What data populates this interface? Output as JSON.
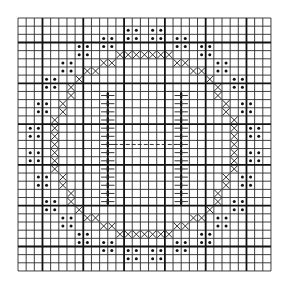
{
  "chart": {
    "title": "",
    "type": "stitch-pattern-grid",
    "origin_px": [
      18,
      18
    ],
    "cell_px": 8.16,
    "cols": 31,
    "rows": 31,
    "major_line_every": 5,
    "major_line_offset": 3,
    "colors": {
      "background": "#ffffff",
      "grid": "#2a2a2a",
      "grid_major": "#111111",
      "symbol": "#111111"
    },
    "legend": {
      "x_symbol": "cross-stitch",
      "dot_symbol": "dot-stitch",
      "ladder_symbol": "vertical-ladder"
    },
    "x_cells": [
      [
        4,
        12
      ],
      [
        4,
        13
      ],
      [
        4,
        14
      ],
      [
        4,
        15
      ],
      [
        4,
        16
      ],
      [
        4,
        17
      ],
      [
        4,
        18
      ],
      [
        26,
        12
      ],
      [
        26,
        13
      ],
      [
        26,
        14
      ],
      [
        26,
        15
      ],
      [
        26,
        16
      ],
      [
        26,
        17
      ],
      [
        26,
        18
      ],
      [
        12,
        4
      ],
      [
        13,
        4
      ],
      [
        14,
        4
      ],
      [
        15,
        4
      ],
      [
        16,
        4
      ],
      [
        17,
        4
      ],
      [
        18,
        4
      ],
      [
        12,
        26
      ],
      [
        13,
        26
      ],
      [
        14,
        26
      ],
      [
        15,
        26
      ],
      [
        16,
        26
      ],
      [
        17,
        26
      ],
      [
        18,
        26
      ],
      [
        10,
        5
      ],
      [
        11,
        5
      ],
      [
        19,
        5
      ],
      [
        20,
        5
      ],
      [
        10,
        25
      ],
      [
        11,
        25
      ],
      [
        19,
        25
      ],
      [
        20,
        25
      ],
      [
        5,
        10
      ],
      [
        5,
        11
      ],
      [
        25,
        10
      ],
      [
        25,
        11
      ],
      [
        5,
        19
      ],
      [
        5,
        20
      ],
      [
        25,
        19
      ],
      [
        25,
        20
      ],
      [
        8,
        6
      ],
      [
        9,
        6
      ],
      [
        21,
        6
      ],
      [
        22,
        6
      ],
      [
        8,
        24
      ],
      [
        9,
        24
      ],
      [
        21,
        24
      ],
      [
        22,
        24
      ],
      [
        6,
        8
      ],
      [
        6,
        9
      ],
      [
        24,
        8
      ],
      [
        24,
        9
      ],
      [
        6,
        21
      ],
      [
        6,
        22
      ],
      [
        24,
        21
      ],
      [
        24,
        22
      ],
      [
        7,
        7
      ],
      [
        23,
        7
      ],
      [
        7,
        23
      ],
      [
        23,
        23
      ]
    ],
    "dot_blocks": [
      [
        13,
        1
      ],
      [
        16,
        1
      ],
      [
        10,
        2
      ],
      [
        19,
        2
      ],
      [
        7,
        3
      ],
      [
        22,
        3
      ],
      [
        5,
        5
      ],
      [
        24,
        5
      ],
      [
        3,
        7
      ],
      [
        26,
        7
      ],
      [
        2,
        10
      ],
      [
        27,
        10
      ],
      [
        1,
        13
      ],
      [
        28,
        13
      ],
      [
        1,
        16
      ],
      [
        28,
        16
      ],
      [
        2,
        19
      ],
      [
        27,
        19
      ],
      [
        3,
        22
      ],
      [
        26,
        22
      ],
      [
        5,
        24
      ],
      [
        24,
        24
      ],
      [
        7,
        26
      ],
      [
        22,
        26
      ],
      [
        10,
        27
      ],
      [
        19,
        27
      ],
      [
        13,
        28
      ],
      [
        16,
        28
      ]
    ],
    "ladders": [
      {
        "spine_col_boundary": 11,
        "row_start": 9,
        "row_end": 23,
        "rung_from_col": 9,
        "rung_to_col": 13
      },
      {
        "spine_col_boundary": 20,
        "row_start": 9,
        "row_end": 23,
        "rung_from_col": 18,
        "rung_to_col": 22
      }
    ],
    "middle_line": {
      "row": 15.5,
      "from_col_boundary": 11,
      "to_col_boundary": 20
    }
  }
}
